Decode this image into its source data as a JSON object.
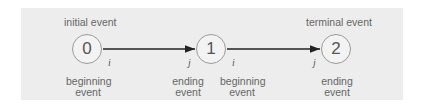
{
  "diagram": {
    "nodes": [
      {
        "id": "0",
        "top_label": "initial event",
        "bottom_label": [
          "beginning",
          "event"
        ]
      },
      {
        "id": "1",
        "top_label": "",
        "bottom_label_left": [
          "ending",
          "event"
        ],
        "bottom_label_right": [
          "beginning",
          "event"
        ]
      },
      {
        "id": "2",
        "top_label": "terminal event",
        "bottom_label": [
          "ending",
          "event"
        ]
      }
    ],
    "edges": [
      {
        "from": "0",
        "to": "1",
        "tail_label": "i",
        "head_label": "j"
      },
      {
        "from": "1",
        "to": "2",
        "tail_label": "i",
        "head_label": "j"
      }
    ]
  }
}
